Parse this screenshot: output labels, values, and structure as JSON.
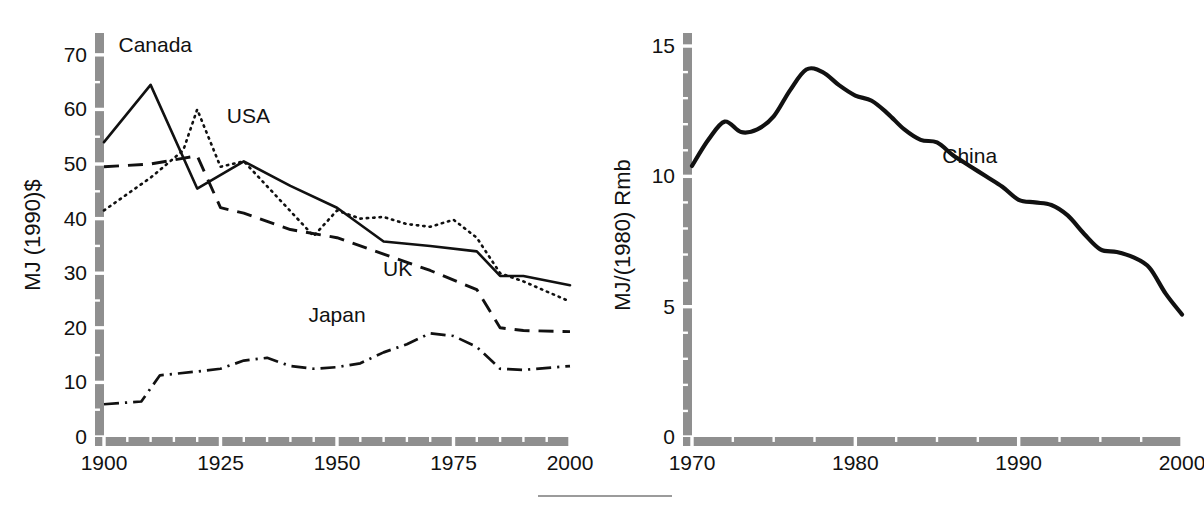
{
  "figure": {
    "background_color": "#ffffff",
    "ink_color": "#111111",
    "axis_color": "#8f8f8f",
    "footer_rule": {
      "present": true
    }
  },
  "chart_data": [
    {
      "id": "left",
      "type": "line",
      "title": "",
      "xlabel": "",
      "ylabel": "MJ (1990)$",
      "xlim": [
        1900,
        2000
      ],
      "ylim": [
        0,
        74
      ],
      "grid": false,
      "legend_position": "inline-annotations",
      "xticks": [
        1900,
        1925,
        1950,
        1975,
        2000
      ],
      "xticklabels": [
        "1900",
        "1925",
        "1950",
        "1975",
        "2000"
      ],
      "x_minor_tick_step": 5,
      "yticks": [
        0,
        10,
        20,
        30,
        40,
        50,
        60,
        70
      ],
      "yticklabels": [
        "0",
        "10",
        "20",
        "30",
        "40",
        "50",
        "60",
        "70"
      ],
      "y_minor_tick_step": 5,
      "series": [
        {
          "name": "Canada",
          "style": "solid",
          "label_position": {
            "x": 1911,
            "y": 70.5
          },
          "x": [
            1900,
            1910,
            1920,
            1930,
            1940,
            1950,
            1960,
            1970,
            1980,
            1985,
            1990,
            2000
          ],
          "values": [
            54.0,
            64.5,
            45.5,
            50.5,
            46.0,
            42.0,
            35.8,
            35.0,
            34.0,
            29.5,
            29.5,
            27.8
          ]
        },
        {
          "name": "USA",
          "style": "dotted",
          "label_position": {
            "x": 1931,
            "y": 57.5
          },
          "x": [
            1900,
            1910,
            1917,
            1920,
            1925,
            1930,
            1945,
            1950,
            1955,
            1960,
            1965,
            1970,
            1975,
            1980,
            1985,
            1990,
            2000
          ],
          "values": [
            41.5,
            47.5,
            52.5,
            60.0,
            49.5,
            50.5,
            36.8,
            41.5,
            40.0,
            40.3,
            39.0,
            38.5,
            39.8,
            36.5,
            30.0,
            28.5,
            24.8
          ]
        },
        {
          "name": "UK",
          "style": "dashed",
          "label_position": {
            "x": 1963,
            "y": 29.5
          },
          "x": [
            1900,
            1910,
            1920,
            1925,
            1930,
            1940,
            1950,
            1960,
            1970,
            1980,
            1985,
            1990,
            2000
          ],
          "values": [
            49.5,
            50.0,
            51.5,
            42.0,
            41.0,
            38.0,
            36.5,
            33.5,
            30.5,
            27.0,
            20.0,
            19.5,
            19.3
          ]
        },
        {
          "name": "Japan",
          "style": "dashdot",
          "label_position": {
            "x": 1950,
            "y": 21.0
          },
          "x": [
            1900,
            1908,
            1912,
            1920,
            1925,
            1930,
            1935,
            1940,
            1945,
            1950,
            1955,
            1960,
            1965,
            1970,
            1975,
            1980,
            1985,
            1990,
            2000
          ],
          "values": [
            6.0,
            6.5,
            11.3,
            12.0,
            12.5,
            14.0,
            14.5,
            13.0,
            12.5,
            12.8,
            13.5,
            15.5,
            17.0,
            19.0,
            18.5,
            16.5,
            12.5,
            12.3,
            13.0
          ]
        }
      ]
    },
    {
      "id": "right",
      "type": "line",
      "title": "",
      "xlabel": "",
      "ylabel": "MJ/(1980) Rmb",
      "xlim": [
        1970,
        2000
      ],
      "ylim": [
        0,
        15.5
      ],
      "grid": false,
      "legend_position": "inline-annotations",
      "xticks": [
        1970,
        1980,
        1990,
        2000
      ],
      "xticklabels": [
        "1970",
        "1980",
        "1990",
        "2000"
      ],
      "x_minor_tick_step": 2.5,
      "yticks": [
        0,
        5,
        10,
        15
      ],
      "yticklabels": [
        "0",
        "5",
        "10",
        "15"
      ],
      "y_minor_tick_step": 1,
      "series": [
        {
          "name": "China",
          "style": "solid-thick",
          "label_position": {
            "x": 1987.0,
            "y": 10.5
          },
          "x": [
            1970,
            1971,
            1972,
            1973,
            1974,
            1975,
            1976,
            1977,
            1978,
            1979,
            1980,
            1981,
            1982,
            1983,
            1984,
            1985,
            1986,
            1987,
            1988,
            1989,
            1990,
            1991,
            1992,
            1993,
            1994,
            1995,
            1996,
            1997,
            1998,
            1999,
            2000
          ],
          "values": [
            10.4,
            11.4,
            12.1,
            11.7,
            11.8,
            12.3,
            13.3,
            14.1,
            14.0,
            13.5,
            13.1,
            12.9,
            12.4,
            11.8,
            11.4,
            11.3,
            10.8,
            10.4,
            10.0,
            9.6,
            9.1,
            9.0,
            8.9,
            8.5,
            7.8,
            7.2,
            7.1,
            6.9,
            6.5,
            5.5,
            4.7
          ]
        }
      ]
    }
  ]
}
